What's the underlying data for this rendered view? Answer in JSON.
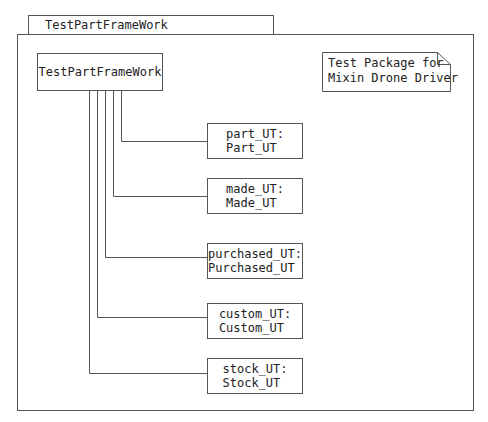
{
  "package": {
    "name": "TestPartFrameWork"
  },
  "main_component": {
    "label": "TestPartFrameWork"
  },
  "note": {
    "line1": "Test Package for",
    "line2": "Mixin Drone Driver"
  },
  "components": [
    {
      "instance": "part_UT:",
      "type": "Part_UT"
    },
    {
      "instance": "made_UT:",
      "type": "Made_UT"
    },
    {
      "instance": "purchased_UT:",
      "type": "Purchased_UT"
    },
    {
      "instance": "custom_UT:",
      "type": "Custom_UT"
    },
    {
      "instance": "stock_UT:",
      "type": "Stock_UT"
    }
  ],
  "colors": {
    "line": "#555555",
    "background": "#ffffff",
    "text": "#222222"
  }
}
